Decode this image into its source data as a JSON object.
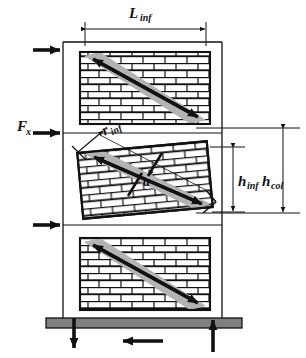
{
  "figure": {
    "type": "engineering-diagram",
    "background_color": "#ffffff",
    "line_color": "#111111",
    "strut_color": "#b3b3b3",
    "brick_fill": "#ffffff",
    "foundation_color": "#808080"
  },
  "labels": {
    "L_inf": {
      "base": "L",
      "sub": "inf"
    },
    "F_x": {
      "base": "F",
      "sub": "x"
    },
    "r_inf": {
      "base": "r",
      "sub": "inf"
    },
    "a": {
      "base": "a",
      "sub": ""
    },
    "h_inf": {
      "base": "h",
      "sub": "inf"
    },
    "h_col": {
      "base": "h",
      "sub": "col"
    }
  },
  "panels": [
    {
      "name": "infill-panel-top",
      "x": 80,
      "y": 52,
      "w": 130,
      "h": 72
    },
    {
      "name": "infill-panel-middle",
      "x": 80,
      "y": 146,
      "w": 130,
      "h": 68
    },
    {
      "name": "infill-panel-bottom",
      "x": 80,
      "y": 238,
      "w": 130,
      "h": 72
    }
  ],
  "frame": {
    "left_column_x": 63,
    "right_column_x": 222,
    "top_y": 42,
    "bottom_y": 318
  },
  "foundation": {
    "x": 46,
    "y": 318,
    "w": 196,
    "h": 10
  },
  "force_arrows": [
    {
      "name": "lateral-force-arrow-top",
      "y": 50,
      "direction": "right"
    },
    {
      "name": "lateral-force-arrow-middle",
      "y": 133,
      "direction": "right"
    },
    {
      "name": "lateral-force-arrow-bottom",
      "y": 225,
      "direction": "right"
    }
  ],
  "reaction_arrows": [
    {
      "name": "reaction-arrow-down",
      "direction": "down"
    },
    {
      "name": "reaction-arrow-shear",
      "direction": "left"
    },
    {
      "name": "reaction-arrow-up",
      "direction": "up"
    }
  ],
  "dimensions": [
    {
      "name": "dimension-L-inf",
      "label": "L_inf",
      "orientation": "horizontal",
      "from": 85,
      "to": 206,
      "at": 29
    },
    {
      "name": "dimension-h-inf",
      "label": "h_inf",
      "orientation": "vertical",
      "from": 147,
      "to": 212,
      "at": 233
    },
    {
      "name": "dimension-h-col",
      "label": "h_col",
      "orientation": "vertical",
      "from": 128,
      "to": 213,
      "at": 283
    },
    {
      "name": "dimension-r-inf",
      "label": "r_inf",
      "orientation": "diagonal"
    },
    {
      "name": "dimension-a",
      "label": "a",
      "orientation": "diagonal-perpendicular"
    }
  ]
}
